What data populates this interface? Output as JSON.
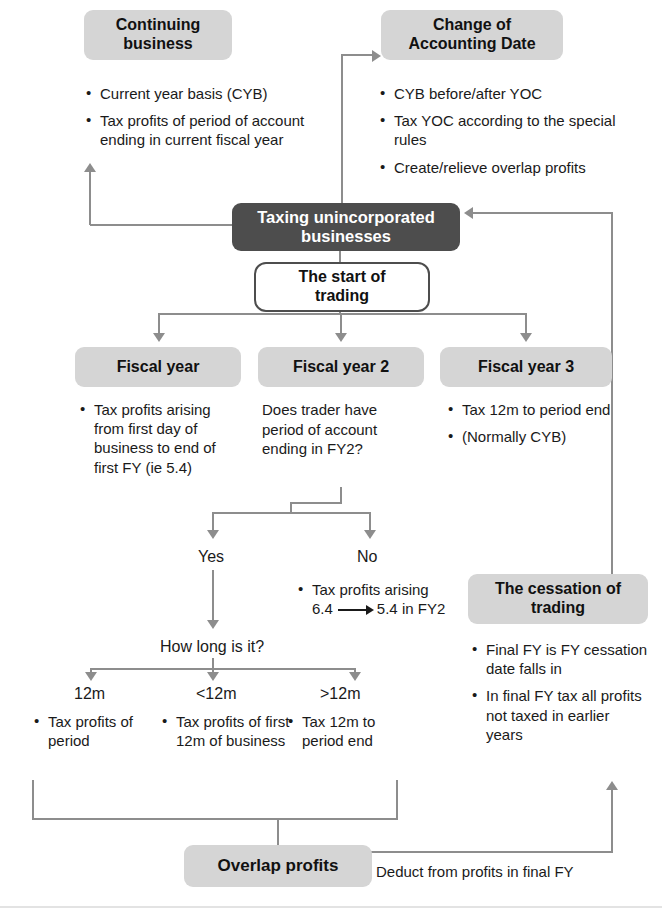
{
  "diagram": {
    "title": "Taxing unincorporated businesses",
    "type": "flowchart",
    "colors": {
      "pill_gray": "#d5d5d5",
      "pill_dark": "#4d4d4d",
      "connector": "#8d8d8d",
      "text": "#1a1a1a",
      "page": "#ffffff"
    }
  },
  "nodes": {
    "continuing_business": {
      "label": "Continuing\nbusiness",
      "label_line1": "Continuing",
      "label_line2": "business",
      "bullets": [
        "Current year basis (CYB)",
        "Tax profits of period of account ending in current fiscal year"
      ]
    },
    "change_of_accounting_date": {
      "label_line1": "Change of",
      "label_line2": "Accounting Date",
      "bullets": [
        "CYB before/after YOC",
        "Tax YOC according to the special rules",
        "Create/relieve overlap profits"
      ]
    },
    "central": {
      "label_line1": "Taxing unincorporated",
      "label_line2": "businesses"
    },
    "start_of_trading": {
      "label_line1": "The start of",
      "label_line2": "trading"
    },
    "fiscal_year_1": {
      "label": "Fiscal year",
      "bullets": [
        "Tax profits arising from first day of business to end of first FY (ie 5.4)"
      ]
    },
    "fiscal_year_2": {
      "label": "Fiscal year 2",
      "question": "Does trader have period of account ending in FY2?"
    },
    "fiscal_year_3": {
      "label": "Fiscal year 3",
      "bullets": [
        "Tax 12m to period end",
        "(Normally CYB)"
      ]
    },
    "cessation_of_trading": {
      "label_line1": "The cessation of",
      "label_line2": "trading",
      "bullets": [
        "Final FY is FY cessation date falls in",
        "In final FY tax all profits not taxed in earlier years"
      ]
    },
    "overlap_profits": {
      "label": "Overlap profits"
    }
  },
  "branches": {
    "yes": {
      "label": "Yes"
    },
    "no": {
      "label": "No",
      "bullet_prefix": "Tax profits arising",
      "bullet_from": "6.4",
      "bullet_to": "5.4 in FY2"
    },
    "how_long": {
      "label": "How long is it?"
    },
    "duration": [
      {
        "label": "12m",
        "bullets": [
          "Tax profits of period"
        ]
      },
      {
        "label": "<12m",
        "bullets": [
          "Tax profits of first 12m of business"
        ]
      },
      {
        "label": ">12m",
        "bullets": [
          "Tax 12m to period end"
        ]
      }
    ]
  },
  "edges": {
    "overlap_to_cessation_label": "Deduct from profits in final FY"
  }
}
